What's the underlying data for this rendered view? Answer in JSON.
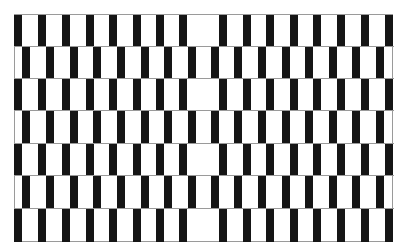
{
  "figure": {
    "type": "cafe-wall-illusion",
    "grid": {
      "left": 14,
      "top": 14,
      "right": 393,
      "bottom": 242
    },
    "row_count": 7,
    "row_boundaries": [
      14,
      46,
      78,
      110,
      143,
      175,
      208,
      242
    ],
    "bar_width": 8,
    "colors": {
      "bar": "#151515",
      "background": "#ffffff",
      "mortar": "#9a9a9a"
    },
    "odd_row_bars": [
      14,
      38,
      62,
      86,
      109,
      133,
      156,
      179,
      219,
      243,
      266,
      290,
      313,
      337,
      361,
      385
    ],
    "even_row_bars": [
      22,
      46,
      70,
      93,
      117,
      141,
      164,
      188,
      211,
      234,
      258,
      282,
      305,
      329,
      352,
      376
    ]
  }
}
